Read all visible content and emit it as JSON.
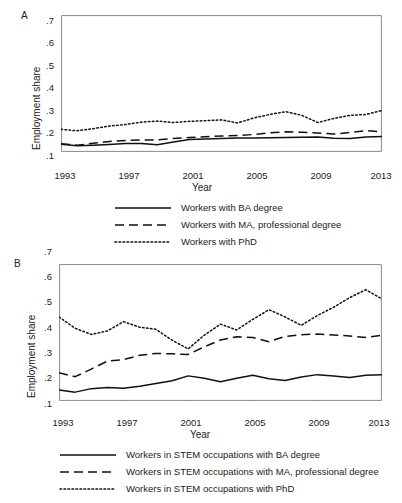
{
  "figure": {
    "panels": [
      {
        "id": "A",
        "label": "A",
        "ylabel": "Employment share",
        "xlabel": "Year",
        "yticks": [
          ".1",
          ".2",
          ".3",
          ".4",
          ".5",
          ".6",
          ".7"
        ],
        "xticks": [
          "1993",
          "1997",
          "2001",
          "2005",
          "2009",
          "2013"
        ],
        "legend": [
          {
            "style": "solid",
            "label": "Workers with BA degree"
          },
          {
            "style": "dashed",
            "label": "Workers with MA, professional degree"
          },
          {
            "style": "dotted",
            "label": "Workers with PhD"
          }
        ]
      },
      {
        "id": "B",
        "label": "B",
        "ylabel": "Employment share",
        "xlabel": "Year",
        "yticks": [
          ".1",
          ".2",
          ".3",
          ".4",
          ".5",
          ".6",
          ".7"
        ],
        "xticks": [
          "1993",
          "1997",
          "2001",
          "2005",
          "2009",
          "2013"
        ],
        "legend": [
          {
            "style": "solid",
            "label": "Workers in STEM occupations with BA degree"
          },
          {
            "style": "dashed",
            "label": "Workers in STEM occupations with MA, professional degree"
          },
          {
            "style": "dotted",
            "label": "Workers in STEM occupations with PhD"
          }
        ]
      }
    ]
  },
  "chart_data": [
    {
      "type": "line",
      "panel": "A",
      "title": "",
      "xlabel": "Year",
      "ylabel": "Employment share",
      "xlim": [
        1993,
        2013
      ],
      "ylim": [
        0.07,
        0.735
      ],
      "ytick_values": [
        0.1,
        0.2,
        0.3,
        0.4,
        0.5,
        0.6,
        0.7
      ],
      "xtick_values": [
        1993,
        1997,
        2001,
        2005,
        2009,
        2013
      ],
      "grid": false,
      "legend_position": "below",
      "x": [
        1993,
        1994,
        1995,
        1996,
        1997,
        1998,
        1999,
        2000,
        2001,
        2002,
        2003,
        2004,
        2005,
        2006,
        2007,
        2008,
        2009,
        2010,
        2011,
        2012,
        2013
      ],
      "series": [
        {
          "name": "Workers with BA degree",
          "style": "solid",
          "values": [
            0.108,
            0.1,
            0.103,
            0.107,
            0.111,
            0.111,
            0.105,
            0.119,
            0.131,
            0.133,
            0.136,
            0.138,
            0.138,
            0.139,
            0.14,
            0.141,
            0.143,
            0.137,
            0.135,
            0.143,
            0.145
          ]
        },
        {
          "name": "Workers with MA, professional degree",
          "style": "dashed",
          "values": [
            0.11,
            0.103,
            0.112,
            0.121,
            0.126,
            0.128,
            0.129,
            0.136,
            0.14,
            0.144,
            0.148,
            0.15,
            0.155,
            0.163,
            0.168,
            0.166,
            0.162,
            0.157,
            0.165,
            0.174,
            0.168
          ]
        },
        {
          "name": "Workers with PhD",
          "style": "dotted",
          "values": [
            0.18,
            0.173,
            0.183,
            0.196,
            0.203,
            0.215,
            0.22,
            0.213,
            0.219,
            0.222,
            0.226,
            0.211,
            0.235,
            0.252,
            0.266,
            0.248,
            0.213,
            0.233,
            0.248,
            0.252,
            0.272
          ]
        }
      ]
    },
    {
      "type": "line",
      "panel": "B",
      "title": "",
      "xlabel": "Year",
      "ylabel": "Employment share",
      "xlim": [
        1993,
        2013
      ],
      "ylim": [
        0.07,
        0.735
      ],
      "ytick_values": [
        0.1,
        0.2,
        0.3,
        0.4,
        0.5,
        0.6,
        0.7
      ],
      "xtick_values": [
        1993,
        1997,
        2001,
        2005,
        2009,
        2013
      ],
      "grid": false,
      "legend_position": "below",
      "x": [
        1993,
        1994,
        1995,
        1996,
        1997,
        1998,
        1999,
        2000,
        2001,
        2002,
        2003,
        2004,
        2005,
        2006,
        2007,
        2008,
        2009,
        2010,
        2011,
        2012,
        2013
      ],
      "series": [
        {
          "name": "Workers in STEM occupations with BA degree",
          "style": "solid",
          "values": [
            0.123,
            0.113,
            0.13,
            0.136,
            0.132,
            0.142,
            0.155,
            0.168,
            0.192,
            0.18,
            0.163,
            0.18,
            0.195,
            0.178,
            0.17,
            0.186,
            0.198,
            0.191,
            0.184,
            0.195,
            0.197
          ]
        },
        {
          "name": "Workers in STEM occupations with MA, professional degree",
          "style": "dashed",
          "values": [
            0.207,
            0.188,
            0.225,
            0.264,
            0.271,
            0.292,
            0.301,
            0.299,
            0.296,
            0.333,
            0.366,
            0.382,
            0.378,
            0.358,
            0.383,
            0.392,
            0.395,
            0.39,
            0.386,
            0.378,
            0.39
          ]
        },
        {
          "name": "Workers in STEM occupations with PhD",
          "style": "dotted",
          "values": [
            0.478,
            0.423,
            0.393,
            0.41,
            0.455,
            0.428,
            0.418,
            0.365,
            0.323,
            0.39,
            0.443,
            0.415,
            0.466,
            0.513,
            0.478,
            0.437,
            0.485,
            0.525,
            0.572,
            0.61,
            0.565
          ]
        }
      ]
    }
  ]
}
